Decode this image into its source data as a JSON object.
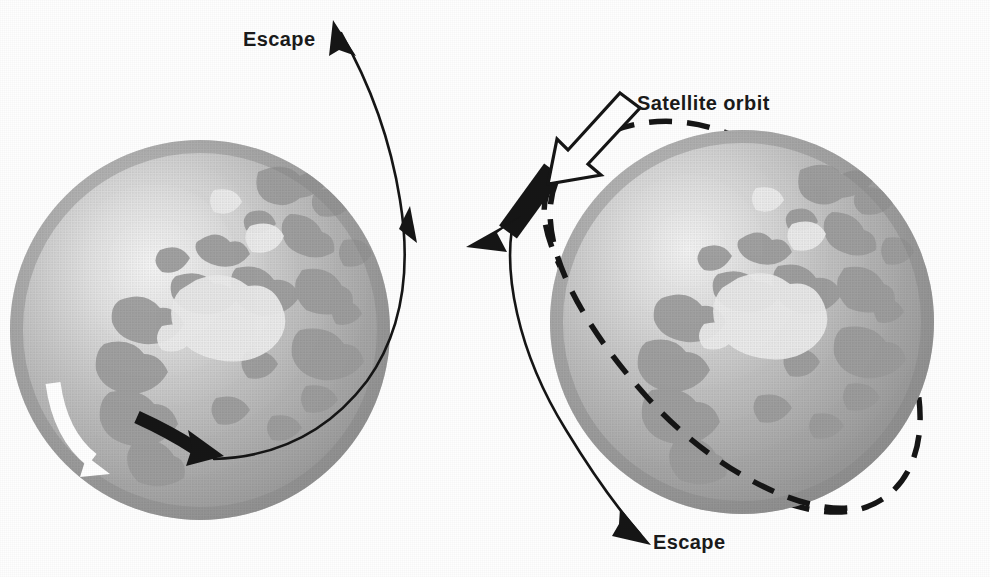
{
  "figure": {
    "type": "diagram",
    "background_color": "#fefefe",
    "ink_color": "#161616",
    "width": 990,
    "height": 577
  },
  "labels": {
    "escape_left": "Escape",
    "satellite_orbit": "Satellite orbit",
    "escape_right": "Escape"
  },
  "panels": [
    {
      "id": "left-panel",
      "name": "escape-panel",
      "globe": {
        "name": "earth-globe-left",
        "center_x": 200,
        "center_y": 330,
        "radius": 190,
        "sphere_light": "#f2f2f2",
        "sphere_mid": "#b6b6b6",
        "sphere_dark": "#8f8f8f",
        "land_color": "#9a9a9a",
        "ice_color": "#ececec"
      },
      "markers": [
        {
          "name": "white-rotation-arrow",
          "color": "#ffffff",
          "description": "white curved arrow on globe surface pointing down"
        },
        {
          "name": "black-launch-arrow",
          "color": "#161616",
          "description": "thick black curved arrow pointing right along the surface"
        },
        {
          "name": "escape-trajectory-curve",
          "color": "#161616",
          "style": "solid",
          "description": "thin solid curve leaving the globe and arcing up to the top-left with two arrowheads"
        }
      ]
    },
    {
      "id": "right-panel",
      "name": "satellite-orbit-panel",
      "globe": {
        "name": "earth-globe-right",
        "center_x": 742,
        "center_y": 322,
        "radius": 192,
        "sphere_light": "#f2f2f2",
        "sphere_mid": "#b6b6b6",
        "sphere_dark": "#8f8f8f",
        "land_color": "#9a9a9a",
        "ice_color": "#ececec"
      },
      "markers": [
        {
          "name": "white-outline-pointer-arrow",
          "color": "#ffffff",
          "outline": "#161616",
          "description": "hollow white arrow with black outline pointing down-left at the black launch arrow"
        },
        {
          "name": "black-launch-arrow",
          "color": "#161616",
          "description": "thick black arrow pointing down-left, tangent to the orbit"
        },
        {
          "name": "satellite-orbit-curve",
          "color": "#161616",
          "style": "dashed",
          "description": "dashed closed elliptical orbit around the globe"
        },
        {
          "name": "escape-trajectory-curve",
          "color": "#161616",
          "style": "solid",
          "description": "thin solid curve passing outside the globe down to the bottom with an arrowhead"
        }
      ]
    }
  ]
}
